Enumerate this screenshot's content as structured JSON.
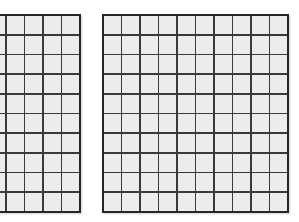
{
  "figure": {
    "colors": {
      "background": "#ffffff",
      "cell_fill": "#ececec",
      "grid_line": "#3a3a3a",
      "outer_border": "#262626"
    },
    "grids": [
      {
        "id": "left-grid",
        "rows": 10,
        "cols": 10,
        "cut_off_edge": "left",
        "visible_full_columns": 4,
        "partial_column_visible": true
      },
      {
        "id": "right-grid",
        "rows": 10,
        "cols": 10,
        "cut_off_edge": "none",
        "visible_full_columns": 10,
        "partial_column_visible": false
      }
    ]
  }
}
